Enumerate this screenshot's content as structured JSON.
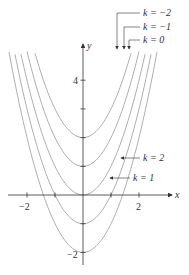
{
  "chart_data": {
    "type": "line",
    "title": "",
    "equation": "y = x^2 - k",
    "xlabel": "x",
    "ylabel": "y",
    "xlim": [
      -2.9,
      3.3
    ],
    "ylim": [
      -2.6,
      5.1
    ],
    "x_ticks": [
      -2,
      -1,
      1,
      2
    ],
    "x_tick_labels": [
      "-2",
      "2"
    ],
    "y_ticks": [
      -2,
      -1,
      1,
      2,
      3,
      4
    ],
    "y_tick_labels": [
      "-2",
      "4"
    ],
    "grid": false,
    "series": [
      {
        "name": "k = -2",
        "k": -2,
        "vertex": [
          0,
          2
        ]
      },
      {
        "name": "k = -1",
        "k": -1,
        "vertex": [
          0,
          1
        ]
      },
      {
        "name": "k = 0",
        "k": 0,
        "vertex": [
          0,
          0
        ]
      },
      {
        "name": "k = 1",
        "k": 1,
        "vertex": [
          0,
          -1
        ]
      },
      {
        "name": "k = 2",
        "k": 2,
        "vertex": [
          0,
          -2
        ]
      }
    ],
    "annotations": [
      "k = -2",
      "k = -1",
      "k = 0",
      "k = 2",
      "k = 1"
    ]
  },
  "labels": {
    "x_axis": "x",
    "y_axis": "y",
    "tick_x_neg2": "−2",
    "tick_x_2": "2",
    "tick_y_4": "4",
    "tick_y_neg2": "−2",
    "k_neg2": "k = −2",
    "k_neg1": "k = −1",
    "k_0": "k = 0",
    "k_2": "k = 2",
    "k_1": "k = 1"
  }
}
